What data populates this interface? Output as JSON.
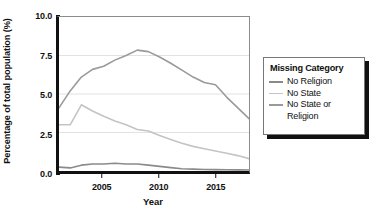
{
  "chart_data": {
    "type": "line",
    "title": "",
    "xlabel": "Year",
    "ylabel": "Percentage of total population (%)",
    "xlim": [
      2001,
      2018
    ],
    "ylim": [
      0.0,
      10.0
    ],
    "xticks": [
      2005,
      2010,
      2015
    ],
    "yticks": [
      "0.0",
      "2.5",
      "5.0",
      "7.5",
      "10.0"
    ],
    "ytick_values": [
      0.0,
      2.5,
      5.0,
      7.5,
      10.0
    ],
    "grid": "horizontal",
    "legend_position": "right-outside",
    "legend_title": "Missing Category",
    "x": [
      2001,
      2002,
      2003,
      2004,
      2005,
      2006,
      2007,
      2008,
      2009,
      2010,
      2011,
      2012,
      2013,
      2014,
      2015,
      2016,
      2017,
      2018
    ],
    "series": [
      {
        "name": "No Religion",
        "color": "#8a8a8a",
        "values": [
          0.25,
          0.2,
          0.38,
          0.45,
          0.45,
          0.5,
          0.45,
          0.45,
          0.38,
          0.3,
          0.22,
          0.15,
          0.12,
          0.1,
          0.09,
          0.08,
          0.07,
          0.06
        ]
      },
      {
        "name": "No State",
        "color": "#c4c4c4",
        "values": [
          3.0,
          3.0,
          4.3,
          3.9,
          3.55,
          3.25,
          3.0,
          2.7,
          2.6,
          2.3,
          2.05,
          1.8,
          1.6,
          1.45,
          1.3,
          1.15,
          1.0,
          0.8
        ]
      },
      {
        "name": "No State or Religion",
        "color": "#9a9a9a",
        "values": [
          4.1,
          5.2,
          6.1,
          6.6,
          6.8,
          7.2,
          7.5,
          7.85,
          7.75,
          7.4,
          7.0,
          6.55,
          6.1,
          5.75,
          5.6,
          4.8,
          4.1,
          3.4
        ]
      }
    ]
  },
  "legend": {
    "title": "Missing Category",
    "items": [
      {
        "label": "No Religion",
        "label2": ""
      },
      {
        "label": "No State",
        "label2": ""
      },
      {
        "label": "No State or",
        "label2": "Religion"
      }
    ]
  },
  "axis": {
    "ylabel": "Percentage of total population (%)",
    "xlabel": "Year",
    "yticks": [
      "0.0",
      "2.5",
      "5.0",
      "7.5",
      "10.0"
    ],
    "xticks": [
      "2005",
      "2010",
      "2015"
    ]
  }
}
